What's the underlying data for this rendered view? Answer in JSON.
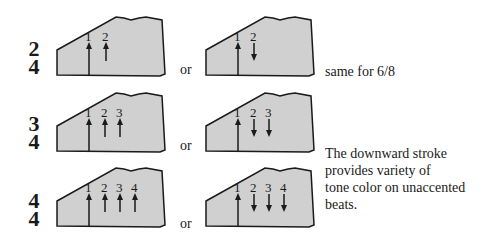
{
  "colors": {
    "shape_fill": "#d0d0d0",
    "stroke": "#1a1a1a",
    "background": "#ffffff"
  },
  "rows": [
    {
      "time_signature": {
        "top": "2",
        "bottom": "4"
      },
      "left": {
        "beats": [
          "1",
          "2"
        ],
        "directions": [
          "up",
          "up"
        ]
      },
      "connector": "or",
      "right": {
        "beats": [
          "1",
          "2"
        ],
        "directions": [
          "up",
          "down"
        ]
      },
      "note": "same for 6/8"
    },
    {
      "time_signature": {
        "top": "3",
        "bottom": "4"
      },
      "left": {
        "beats": [
          "1",
          "2",
          "3"
        ],
        "directions": [
          "up",
          "up",
          "up"
        ]
      },
      "connector": "or",
      "right": {
        "beats": [
          "1",
          "2",
          "3"
        ],
        "directions": [
          "up",
          "down",
          "down"
        ]
      }
    },
    {
      "time_signature": {
        "top": "4",
        "bottom": "4"
      },
      "left": {
        "beats": [
          "1",
          "2",
          "3",
          "4"
        ],
        "directions": [
          "up",
          "up",
          "up",
          "up"
        ]
      },
      "connector": "or",
      "right": {
        "beats": [
          "1",
          "2",
          "3",
          "4"
        ],
        "directions": [
          "up",
          "down",
          "down",
          "down"
        ]
      }
    }
  ],
  "side_note": {
    "lines": [
      "The downward stroke",
      "provides variety of",
      "tone color on unaccented",
      "beats."
    ]
  }
}
